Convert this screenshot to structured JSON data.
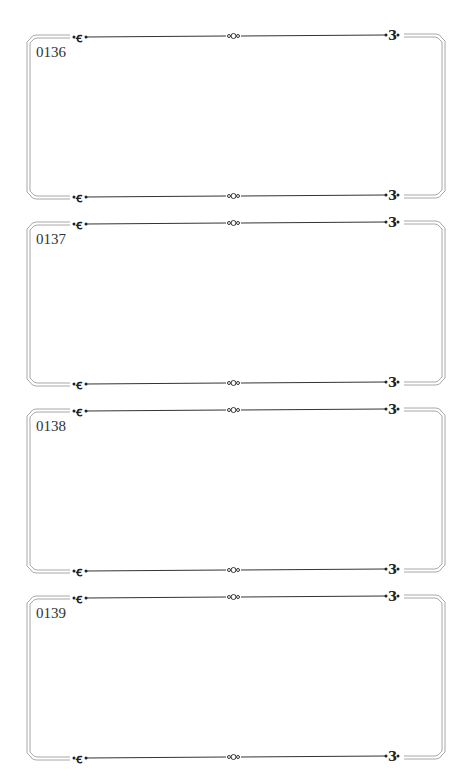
{
  "frames": [
    {
      "label": "0136",
      "top": 28
    },
    {
      "label": "0137",
      "top": 215
    },
    {
      "label": "0138",
      "top": 402
    },
    {
      "label": "0139",
      "top": 589
    }
  ],
  "colors": {
    "line": "#333333",
    "border": "#9a9a9a"
  }
}
